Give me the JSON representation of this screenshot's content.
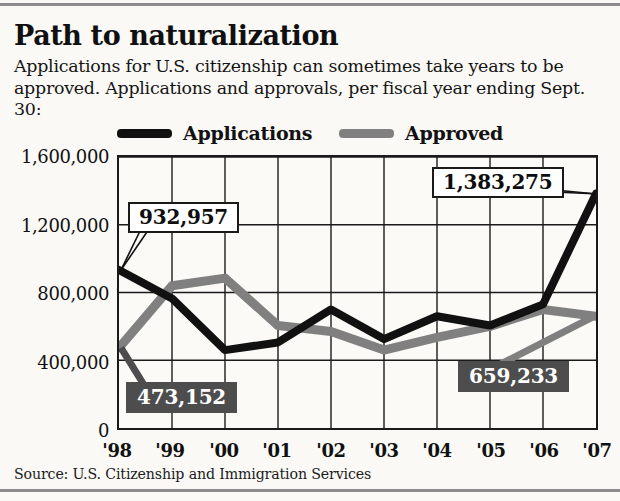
{
  "header": {
    "title": "Path to naturalization",
    "subtitle": "Applications for U.S. citizenship can sometimes take years to be approved. Applications and approvals, per fiscal year ending Sept. 30:"
  },
  "source": "Source: U.S. Citizenship and Immigration Services",
  "colors": {
    "applications": "#111111",
    "approved": "#808080",
    "callout_dark_bg": "#4d4d4d",
    "callout_light_bg": "#ffffff",
    "page_bg": "#faf9f6",
    "rule": "#8c8c8c"
  },
  "legend": {
    "applications_label": "Applications",
    "approved_label": "Approved"
  },
  "axis": {
    "y_ticks": [
      "1,600,000",
      "1,200,000",
      "800,000",
      "400,000",
      "0"
    ],
    "x_ticks": [
      "'98",
      "'99",
      "'00",
      "'01",
      "'02",
      "'03",
      "'04",
      "'05",
      "'06",
      "'07"
    ]
  },
  "callouts": [
    {
      "id": "apps-98",
      "text": "932,957",
      "style": "light"
    },
    {
      "id": "appr-98",
      "text": "473,152",
      "style": "dark"
    },
    {
      "id": "apps-07",
      "text": "1,383,275",
      "style": "light"
    },
    {
      "id": "appr-07",
      "text": "659,233",
      "style": "dark"
    }
  ],
  "chart_data": {
    "type": "line",
    "title": "Path to naturalization",
    "subtitle": "Applications for U.S. citizenship can sometimes take years to be approved. Applications and approvals, per fiscal year ending Sept. 30:",
    "xlabel": "",
    "ylabel": "",
    "categories": [
      "'98",
      "'99",
      "'00",
      "'01",
      "'02",
      "'03",
      "'04",
      "'05",
      "'06",
      "'07"
    ],
    "ylim": [
      0,
      1600000
    ],
    "ytick_values": [
      0,
      400000,
      800000,
      1200000,
      1600000
    ],
    "grid": true,
    "legend_position": "top",
    "series": [
      {
        "name": "Applications",
        "color": "#111111",
        "values": [
          932957,
          765000,
          460000,
          505000,
          700000,
          525000,
          660000,
          605000,
          730000,
          1383275
        ],
        "labeled_points": {
          "'98": "932,957",
          "'07": "1,383,275"
        }
      },
      {
        "name": "Approved",
        "color": "#808080",
        "values": [
          473152,
          840000,
          885000,
          605000,
          570000,
          460000,
          535000,
          600000,
          700000,
          659233
        ],
        "labeled_points": {
          "'98": "473,152",
          "'07": "659,233"
        }
      }
    ]
  }
}
